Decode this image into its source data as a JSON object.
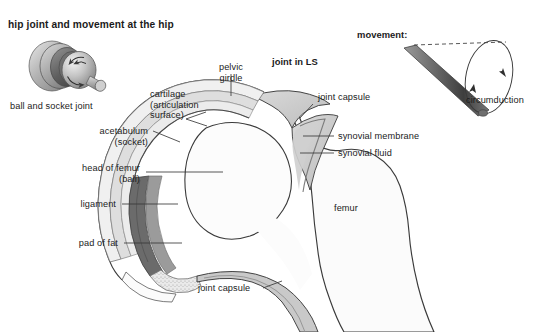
{
  "figure": {
    "title": "hip joint and movement at the hip",
    "background_color": "#ffffff",
    "text_color": "#1b1b1b",
    "line_color": "#3a3a3a"
  },
  "panels": {
    "ball_socket": {
      "caption": "ball and socket joint"
    },
    "cross_section": {
      "heading": "joint in LS"
    },
    "movement": {
      "heading": "movement:",
      "caption": "circumduction"
    }
  },
  "labels": {
    "pelvic_girdle": "pelvic\ngirdle",
    "cartilage": "cartilage\n(articulation\nsurface)",
    "acetabulum": "acetabulum\n(socket)",
    "head_of_femur": "head of femur\n(ball)",
    "ligament": "ligament",
    "pad_of_fat": "pad of fat",
    "joint_capsule_top": "joint capsule",
    "synovial_membrane": "synovial membrane",
    "synovial_fluid": "synovial fluid",
    "femur": "femur",
    "joint_capsule_bottom": "joint capsule"
  },
  "palette": {
    "bone_fill": "#fbfbfb",
    "capsule_fill": "#d4d4d4",
    "membrane_fill": "#c2c2c2",
    "cartilage_fill": "#e6e6e6",
    "ligament_fill": "#6e6e6e",
    "fat_fill": "#e0e0e0",
    "socket_light": "#bdbdbd",
    "socket_mid": "#9a9a9a",
    "socket_dark": "#6a6a6a",
    "outline": "#3a3a3a"
  }
}
